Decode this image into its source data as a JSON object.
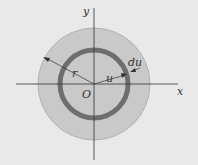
{
  "diagram": {
    "labels": {
      "y_axis": "y",
      "x_axis": "x",
      "origin": "O",
      "outer_radius": "r",
      "inner_radius": "u",
      "ring_width": "du"
    },
    "colors": {
      "background": "#e9e9e9",
      "disk": "#c9c9c9",
      "ring": "#6e6e6e",
      "axes": "#333333"
    }
  }
}
